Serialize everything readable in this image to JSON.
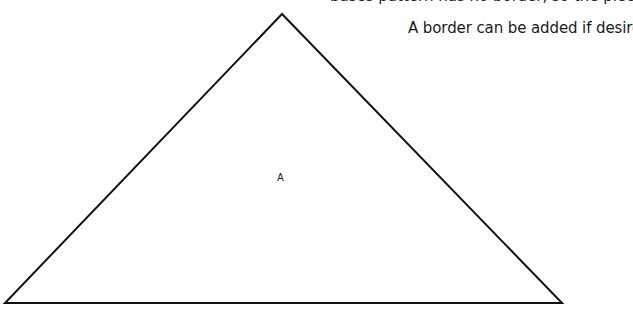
{
  "page": {
    "cut_off_line": "bases pattern has no border, so the piece fits together to form",
    "instruction": "A border can be added if desired."
  },
  "figure": {
    "shape": "triangle",
    "label": "A",
    "stroke_color": "#111111",
    "vertices": {
      "apex": [
        282,
        14
      ],
      "bottom_left": [
        5,
        303
      ],
      "bottom_right": [
        562,
        303
      ]
    }
  }
}
